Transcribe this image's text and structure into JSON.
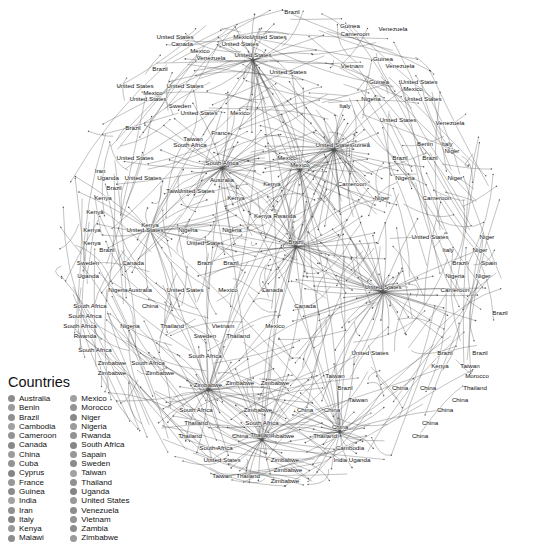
{
  "legend": {
    "title": "Countries",
    "swatch_colors": [
      "#8c8c8c",
      "#9a9a9a",
      "#8f8f8f",
      "#a0a0a0",
      "#939393",
      "#888888",
      "#9c9c9c",
      "#929292",
      "#868686",
      "#979797",
      "#8b8b8b",
      "#a2a2a2",
      "#909090",
      "#858585",
      "#999999",
      "#8d8d8d",
      "#949494"
    ],
    "column1": [
      "Australia",
      "Benin",
      "Brazil",
      "Cambodia",
      "Cameroon",
      "Canada",
      "China",
      "Cuba",
      "Cyprus",
      "France",
      "Guinea",
      "India",
      "Iran",
      "Italy",
      "Kenya",
      "Malawi"
    ],
    "column2": [
      "Mexico",
      "Morocco",
      "Niger",
      "Nigeria",
      "Rwanda",
      "South Africa",
      "Sapain",
      "Sweden",
      "Taiwan",
      "Thailand",
      "Uganda",
      "United States",
      "Venezuela",
      "Vietnam",
      "Zambia",
      "Zimbabwe"
    ]
  },
  "graph": {
    "description": "Force-directed network graph of country co-occurrence with dense hub clusters",
    "hubs": [
      {
        "label": "United States",
        "x": 334,
        "y": 150,
        "spokes": 46
      },
      {
        "label": "United States",
        "x": 383,
        "y": 292,
        "spokes": 52
      },
      {
        "label": "Brazil",
        "x": 296,
        "y": 247,
        "spokes": 40
      },
      {
        "label": "South Africa",
        "x": 222,
        "y": 168,
        "spokes": 34
      },
      {
        "label": "United States",
        "x": 253,
        "y": 60,
        "spokes": 30
      },
      {
        "label": "Zimbabwe",
        "x": 208,
        "y": 390,
        "spokes": 28
      },
      {
        "label": "Thailand",
        "x": 262,
        "y": 440,
        "spokes": 32
      },
      {
        "label": "China",
        "x": 340,
        "y": 432,
        "spokes": 26
      },
      {
        "label": "Kenya",
        "x": 150,
        "y": 230,
        "spokes": 22
      },
      {
        "label": "Mexico",
        "x": 300,
        "y": 170,
        "spokes": 24
      }
    ],
    "labels": [
      {
        "t": "Brazil",
        "x": 292,
        "y": 14
      },
      {
        "t": "Guinea",
        "x": 350,
        "y": 28
      },
      {
        "t": "Cameroon",
        "x": 355,
        "y": 36
      },
      {
        "t": "Venezuela",
        "x": 393,
        "y": 31
      },
      {
        "t": "United States",
        "x": 175,
        "y": 39
      },
      {
        "t": "Mexico",
        "x": 243,
        "y": 39
      },
      {
        "t": "United States",
        "x": 268,
        "y": 39
      },
      {
        "t": "Canada",
        "x": 182,
        "y": 46
      },
      {
        "t": "United States",
        "x": 240,
        "y": 46
      },
      {
        "t": "Mexico",
        "x": 200,
        "y": 53
      },
      {
        "t": "Venezuela",
        "x": 211,
        "y": 60
      },
      {
        "t": "Guinea",
        "x": 383,
        "y": 61
      },
      {
        "t": "Vietnam",
        "x": 352,
        "y": 68
      },
      {
        "t": "Venezuela",
        "x": 400,
        "y": 68
      },
      {
        "t": "United States",
        "x": 288,
        "y": 74
      },
      {
        "t": "Brazil",
        "x": 160,
        "y": 71
      },
      {
        "t": "United States",
        "x": 135,
        "y": 88
      },
      {
        "t": "United States",
        "x": 185,
        "y": 88
      },
      {
        "t": "United States",
        "x": 419,
        "y": 84
      },
      {
        "t": "Guinea",
        "x": 379,
        "y": 84
      },
      {
        "t": "Mexico",
        "x": 413,
        "y": 91
      },
      {
        "t": "Mexico",
        "x": 153,
        "y": 95
      },
      {
        "t": "United States",
        "x": 148,
        "y": 101
      },
      {
        "t": "Nigeria",
        "x": 371,
        "y": 101
      },
      {
        "t": "United States",
        "x": 423,
        "y": 101
      },
      {
        "t": "Sweden",
        "x": 180,
        "y": 108
      },
      {
        "t": "Italy",
        "x": 345,
        "y": 108
      },
      {
        "t": "United States",
        "x": 199,
        "y": 115
      },
      {
        "t": "Mexico",
        "x": 240,
        "y": 115
      },
      {
        "t": "United States",
        "x": 398,
        "y": 122
      },
      {
        "t": "Venezuela",
        "x": 450,
        "y": 125
      },
      {
        "t": "Brazil",
        "x": 133,
        "y": 130
      },
      {
        "t": "France",
        "x": 221,
        "y": 135
      },
      {
        "t": "Taiwan",
        "x": 193,
        "y": 141
      },
      {
        "t": "South Africa",
        "x": 190,
        "y": 147
      },
      {
        "t": "Benin",
        "x": 425,
        "y": 146
      },
      {
        "t": "Italy",
        "x": 447,
        "y": 146
      },
      {
        "t": "Niger",
        "x": 452,
        "y": 153
      },
      {
        "t": "United States",
        "x": 135,
        "y": 160
      },
      {
        "t": "Mexico",
        "x": 287,
        "y": 160
      },
      {
        "t": "Brazil",
        "x": 400,
        "y": 160
      },
      {
        "t": "Brazil",
        "x": 430,
        "y": 160
      },
      {
        "t": "Guinea",
        "x": 360,
        "y": 147
      },
      {
        "t": "Iran",
        "x": 100,
        "y": 173
      },
      {
        "t": "Uganda",
        "x": 108,
        "y": 180
      },
      {
        "t": "United States",
        "x": 143,
        "y": 180
      },
      {
        "t": "Australia",
        "x": 222,
        "y": 182
      },
      {
        "t": "Kenya",
        "x": 272,
        "y": 186
      },
      {
        "t": "Cameroon",
        "x": 352,
        "y": 186
      },
      {
        "t": "Brazil",
        "x": 114,
        "y": 190
      },
      {
        "t": "Taiwan",
        "x": 176,
        "y": 193
      },
      {
        "t": "Nigeria",
        "x": 405,
        "y": 180
      },
      {
        "t": "Niger",
        "x": 455,
        "y": 180
      },
      {
        "t": "United States",
        "x": 196,
        "y": 193
      },
      {
        "t": "Niger",
        "x": 382,
        "y": 200
      },
      {
        "t": "Cameroon",
        "x": 437,
        "y": 200
      },
      {
        "t": "Kenya",
        "x": 103,
        "y": 200
      },
      {
        "t": "Kenya",
        "x": 236,
        "y": 200
      },
      {
        "t": "Kenya",
        "x": 95,
        "y": 214
      },
      {
        "t": "Kenya Rwanda",
        "x": 275,
        "y": 218
      },
      {
        "t": "Kenya",
        "x": 92,
        "y": 232
      },
      {
        "t": "United States",
        "x": 145,
        "y": 232
      },
      {
        "t": "Nigeria",
        "x": 188,
        "y": 232
      },
      {
        "t": "Nigeria",
        "x": 232,
        "y": 232
      },
      {
        "t": "United States",
        "x": 430,
        "y": 239
      },
      {
        "t": "Niger",
        "x": 487,
        "y": 239
      },
      {
        "t": "Kenya",
        "x": 92,
        "y": 245
      },
      {
        "t": "United States",
        "x": 205,
        "y": 245
      },
      {
        "t": "Italy",
        "x": 448,
        "y": 252
      },
      {
        "t": "Niger",
        "x": 480,
        "y": 252
      },
      {
        "t": "Brazil",
        "x": 107,
        "y": 252
      },
      {
        "t": "Sweden",
        "x": 88,
        "y": 265
      },
      {
        "t": "Canada",
        "x": 133,
        "y": 265
      },
      {
        "t": "Brazil",
        "x": 205,
        "y": 265
      },
      {
        "t": "Brazil",
        "x": 231,
        "y": 265
      },
      {
        "t": "Spain",
        "x": 489,
        "y": 265
      },
      {
        "t": "Brazil",
        "x": 460,
        "y": 265
      },
      {
        "t": "Uganda",
        "x": 88,
        "y": 278
      },
      {
        "t": "Nigeria",
        "x": 455,
        "y": 278
      },
      {
        "t": "Niger",
        "x": 483,
        "y": 278
      },
      {
        "t": "Nigeria",
        "x": 118,
        "y": 292
      },
      {
        "t": "Australia",
        "x": 140,
        "y": 292
      },
      {
        "t": "United States",
        "x": 185,
        "y": 292
      },
      {
        "t": "Mexico",
        "x": 228,
        "y": 292
      },
      {
        "t": "Canada",
        "x": 272,
        "y": 292
      },
      {
        "t": "Cameroon",
        "x": 455,
        "y": 292
      },
      {
        "t": "South Africa",
        "x": 90,
        "y": 308
      },
      {
        "t": "South Africa",
        "x": 85,
        "y": 318
      },
      {
        "t": "China",
        "x": 150,
        "y": 308
      },
      {
        "t": "Canada",
        "x": 305,
        "y": 308
      },
      {
        "t": "Brazil",
        "x": 500,
        "y": 315
      },
      {
        "t": "South Africa",
        "x": 80,
        "y": 328
      },
      {
        "t": "Nigeria",
        "x": 130,
        "y": 328
      },
      {
        "t": "Thailand",
        "x": 172,
        "y": 328
      },
      {
        "t": "Vietnam",
        "x": 223,
        "y": 328
      },
      {
        "t": "Mexico",
        "x": 275,
        "y": 328
      },
      {
        "t": "Rwanda",
        "x": 85,
        "y": 338
      },
      {
        "t": "Sweden",
        "x": 205,
        "y": 338
      },
      {
        "t": "Thailand",
        "x": 238,
        "y": 338
      },
      {
        "t": "South Africa",
        "x": 95,
        "y": 352
      },
      {
        "t": "South Africa",
        "x": 205,
        "y": 358
      },
      {
        "t": "United States",
        "x": 370,
        "y": 355
      },
      {
        "t": "Brazil",
        "x": 445,
        "y": 355
      },
      {
        "t": "Brazil",
        "x": 480,
        "y": 355
      },
      {
        "t": "Zimbabwe",
        "x": 112,
        "y": 365
      },
      {
        "t": "South Africa",
        "x": 148,
        "y": 365
      },
      {
        "t": "Kenya",
        "x": 440,
        "y": 368
      },
      {
        "t": "Taiwan",
        "x": 470,
        "y": 368
      },
      {
        "t": "Zimbabwe",
        "x": 112,
        "y": 375
      },
      {
        "t": "Zimbabwe",
        "x": 160,
        "y": 375
      },
      {
        "t": "Taiwan",
        "x": 335,
        "y": 378
      },
      {
        "t": "Morocco",
        "x": 477,
        "y": 378
      },
      {
        "t": "Zimbabwe",
        "x": 240,
        "y": 385
      },
      {
        "t": "Zimbabwe",
        "x": 275,
        "y": 385
      },
      {
        "t": "Brazil",
        "x": 345,
        "y": 390
      },
      {
        "t": "China",
        "x": 400,
        "y": 390
      },
      {
        "t": "China",
        "x": 428,
        "y": 390
      },
      {
        "t": "Thailand",
        "x": 475,
        "y": 390
      },
      {
        "t": "Taiwan",
        "x": 358,
        "y": 402
      },
      {
        "t": "China",
        "x": 460,
        "y": 402
      },
      {
        "t": "South Africa",
        "x": 196,
        "y": 412
      },
      {
        "t": "Zimbabwe",
        "x": 258,
        "y": 412
      },
      {
        "t": "China",
        "x": 305,
        "y": 412
      },
      {
        "t": "China",
        "x": 332,
        "y": 412
      },
      {
        "t": "China",
        "x": 445,
        "y": 412
      },
      {
        "t": "Thailand",
        "x": 196,
        "y": 425
      },
      {
        "t": "South Africa",
        "x": 262,
        "y": 425
      },
      {
        "t": "China",
        "x": 430,
        "y": 425
      },
      {
        "t": "Thailand",
        "x": 190,
        "y": 438
      },
      {
        "t": "China",
        "x": 240,
        "y": 438
      },
      {
        "t": "Zimbabwe",
        "x": 280,
        "y": 438
      },
      {
        "t": "Thailand",
        "x": 325,
        "y": 438
      },
      {
        "t": "China",
        "x": 420,
        "y": 438
      },
      {
        "t": "South Africa",
        "x": 216,
        "y": 450
      },
      {
        "t": "Cambodia",
        "x": 350,
        "y": 450
      },
      {
        "t": "United States",
        "x": 222,
        "y": 462
      },
      {
        "t": "Zimbabwe",
        "x": 285,
        "y": 462
      },
      {
        "t": "India Uganda",
        "x": 352,
        "y": 462
      },
      {
        "t": "Zimbabwe",
        "x": 288,
        "y": 472
      },
      {
        "t": "Taiwan",
        "x": 222,
        "y": 478
      },
      {
        "t": "Thailand",
        "x": 248,
        "y": 478
      },
      {
        "t": "Zimbabwe",
        "x": 285,
        "y": 483
      }
    ]
  }
}
